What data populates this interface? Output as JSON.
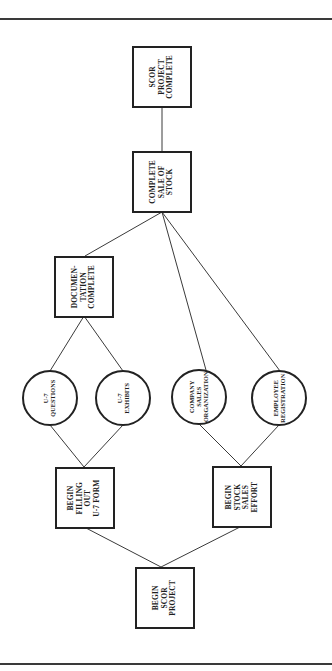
{
  "diagram": {
    "orientation": "rotated -90deg (reads bottom-to-top, flow from bottom to top)",
    "nodes": {
      "begin_scor_project": {
        "shape": "box",
        "lines": [
          "BEGIN",
          "SCOR",
          "PROJECT"
        ]
      },
      "begin_filling_out_u7_form": {
        "shape": "box",
        "lines": [
          "BEGIN",
          "FILLING",
          "OUT",
          "U-7 FORM"
        ]
      },
      "begin_stock_sales_effort": {
        "shape": "box",
        "lines": [
          "BEGIN",
          "STOCK",
          "SALES",
          "EFFORT"
        ]
      },
      "u7_questions": {
        "shape": "circle",
        "lines": [
          "U-7",
          "QUESTIONS"
        ]
      },
      "u7_exhibits": {
        "shape": "circle",
        "lines": [
          "U-7",
          "EXHIBITS"
        ]
      },
      "company_sales_organization": {
        "shape": "circle",
        "lines": [
          "COMPANY",
          "SALES",
          "ORGANIZATION"
        ]
      },
      "employee_registration": {
        "shape": "circle",
        "lines": [
          "EMPLOYEE",
          "REGISTRATION"
        ]
      },
      "documentation_complete": {
        "shape": "box",
        "lines": [
          "DOCUMEN-",
          "TATION",
          "COMPLETE"
        ]
      },
      "complete_sale_of_stock": {
        "shape": "box",
        "lines": [
          "COMPLETE",
          "SALE OF",
          "STOCK"
        ]
      },
      "scor_project_complete": {
        "shape": "box",
        "lines": [
          "SCOR",
          "PROJECT",
          "COMPLETE"
        ]
      }
    },
    "edges": [
      [
        "begin_scor_project",
        "begin_filling_out_u7_form"
      ],
      [
        "begin_scor_project",
        "begin_stock_sales_effort"
      ],
      [
        "begin_filling_out_u7_form",
        "u7_questions"
      ],
      [
        "begin_filling_out_u7_form",
        "u7_exhibits"
      ],
      [
        "begin_stock_sales_effort",
        "company_sales_organization"
      ],
      [
        "begin_stock_sales_effort",
        "employee_registration"
      ],
      [
        "u7_questions",
        "documentation_complete"
      ],
      [
        "u7_exhibits",
        "documentation_complete"
      ],
      [
        "documentation_complete",
        "complete_sale_of_stock"
      ],
      [
        "company_sales_organization",
        "complete_sale_of_stock"
      ],
      [
        "employee_registration",
        "complete_sale_of_stock"
      ],
      [
        "complete_sale_of_stock",
        "scor_project_complete"
      ]
    ],
    "colors": {
      "line": "#3a3a3a",
      "border": "#222222",
      "text": "#1e1e1e",
      "background": "#ffffff"
    }
  }
}
